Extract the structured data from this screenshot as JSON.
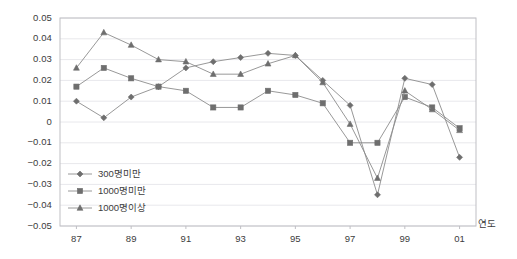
{
  "chart_data": {
    "type": "line",
    "title": "",
    "xlabel": "연도",
    "ylabel": "",
    "x": [
      87,
      88,
      89,
      90,
      91,
      92,
      93,
      94,
      95,
      96,
      97,
      98,
      99,
      100,
      101
    ],
    "x_tick_labels": [
      "87",
      "89",
      "91",
      "93",
      "95",
      "97",
      "99",
      "01"
    ],
    "x_tick_positions": [
      87,
      89,
      91,
      93,
      95,
      97,
      99,
      101
    ],
    "y_tick_labels": [
      "0.05",
      "0.04",
      "0.03",
      "0.02",
      "0.01",
      "0",
      "-0.01",
      "-0.02",
      "-0.03",
      "-0.04",
      "-0.05"
    ],
    "y_tick_values": [
      0.05,
      0.04,
      0.03,
      0.02,
      0.01,
      0,
      -0.01,
      -0.02,
      -0.03,
      -0.04,
      -0.05
    ],
    "ylim": [
      -0.05,
      0.05
    ],
    "xlim": [
      86.4,
      101.6
    ],
    "grid": true,
    "legend_position": "inside-lower-left",
    "series": [
      {
        "name": "300명미만",
        "marker": "diamond",
        "color": "#808080",
        "values": [
          0.01,
          0.002,
          0.012,
          0.017,
          0.026,
          0.029,
          0.031,
          0.033,
          0.032,
          0.02,
          0.008,
          -0.035,
          0.021,
          0.018,
          -0.017
        ]
      },
      {
        "name": "1000명미만",
        "marker": "square",
        "color": "#808080",
        "values": [
          0.017,
          0.026,
          0.021,
          0.017,
          0.015,
          0.007,
          0.007,
          0.015,
          0.013,
          0.009,
          -0.01,
          -0.01,
          0.012,
          0.007,
          -0.003
        ]
      },
      {
        "name": "1000명이상",
        "marker": "triangle",
        "color": "#808080",
        "values": [
          0.026,
          0.043,
          0.037,
          0.03,
          0.029,
          0.023,
          0.023,
          0.028,
          0.032,
          0.019,
          -0.001,
          -0.027,
          0.015,
          0.006,
          -0.004
        ]
      }
    ]
  },
  "legend": {
    "items": [
      {
        "label": "300명미만",
        "marker": "diamond"
      },
      {
        "label": "1000명미만",
        "marker": "square"
      },
      {
        "label": "1000명이상",
        "marker": "triangle"
      }
    ]
  },
  "axis": {
    "x_title": "연도"
  },
  "colors": {
    "line": "#8c8c8c",
    "marker": "#6e6e6e",
    "grid": "#e8e8ec",
    "axis": "#bfbfc4",
    "text": "#3c3c3c"
  }
}
